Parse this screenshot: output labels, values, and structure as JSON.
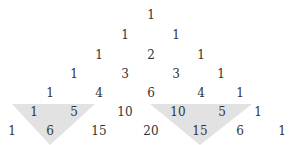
{
  "diagram": {
    "text_color": "#333333",
    "highlight_color": "#e2e2e2",
    "rows": [
      {
        "y": 15,
        "cells": [
          {
            "v": "1",
            "x": 151
          }
        ]
      },
      {
        "y": 35,
        "cells": [
          {
            "v": "1",
            "x": 125
          },
          {
            "v": "1",
            "x": 176
          }
        ]
      },
      {
        "y": 55,
        "cells": [
          {
            "v": "1",
            "x": 99
          },
          {
            "v": "2",
            "x": 151
          },
          {
            "v": "1",
            "x": 201
          }
        ]
      },
      {
        "y": 74,
        "cells": [
          {
            "v": "1",
            "x": 74
          },
          {
            "v": "3",
            "x": 125
          },
          {
            "v": "3",
            "x": 176
          },
          {
            "v": "1",
            "x": 221
          }
        ]
      },
      {
        "y": 93,
        "cells": [
          {
            "v": "1",
            "x": 50
          },
          {
            "v": "4",
            "x": 99
          },
          {
            "v": "6",
            "x": 151
          },
          {
            "v": "4",
            "x": 201
          },
          {
            "v": "1",
            "x": 240
          }
        ]
      },
      {
        "y": 112,
        "cells": [
          {
            "v": "1",
            "x": 34
          },
          {
            "v": "5",
            "x": 74
          },
          {
            "v": "10",
            "x": 125
          },
          {
            "v": "10",
            "x": 178
          },
          {
            "v": "5",
            "x": 222
          },
          {
            "v": "1",
            "x": 258
          }
        ]
      },
      {
        "y": 131,
        "cells": [
          {
            "v": "1",
            "x": 12
          },
          {
            "v": "6",
            "x": 50
          },
          {
            "v": "15",
            "x": 99
          },
          {
            "v": "20",
            "x": 151
          },
          {
            "v": "15",
            "x": 200
          },
          {
            "v": "6",
            "x": 240
          },
          {
            "v": "1",
            "x": 282
          }
        ]
      }
    ],
    "highlights": [
      {
        "name": "left-highlight-triangle",
        "points": "12,104 95,104 50,145",
        "cells": [
          "1",
          "5",
          "6"
        ]
      },
      {
        "name": "right-highlight-triangle",
        "points": "150,104 252,104 200,145",
        "cells": [
          "10",
          "5",
          "15"
        ]
      }
    ]
  }
}
